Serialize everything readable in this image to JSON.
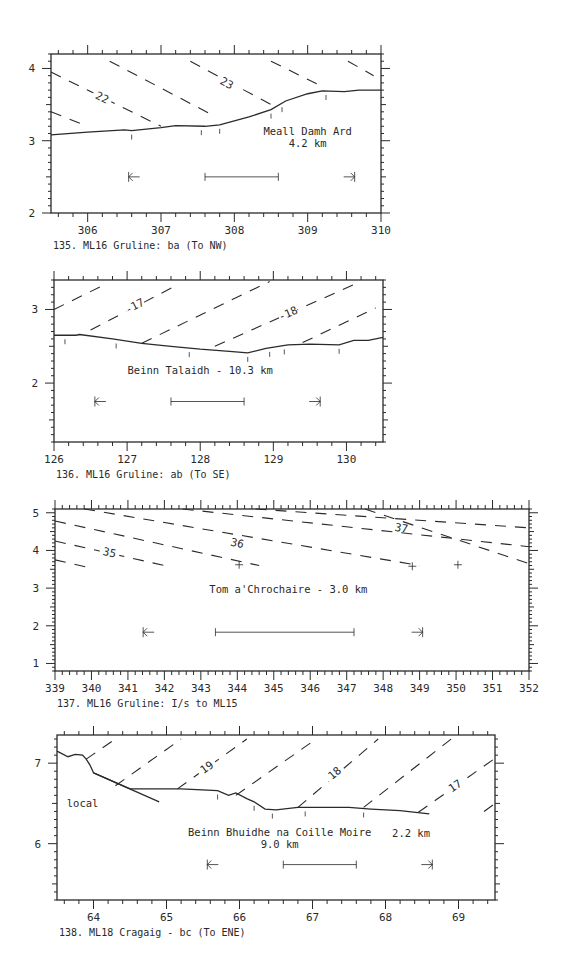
{
  "chart_data": [
    {
      "type": "line",
      "id": "135",
      "caption": "135. ML16 Gruline: ba (To NW)",
      "xlim": [
        305.5,
        310
      ],
      "ylim": [
        2,
        4.2
      ],
      "xticks": [
        306,
        307,
        308,
        309,
        310
      ],
      "yticks": [
        2,
        3,
        4
      ],
      "frame": {
        "left": 51,
        "right": 381,
        "top": 54,
        "bottom": 213
      },
      "profile": [
        [
          305.5,
          3.08
        ],
        [
          306,
          3.12
        ],
        [
          306.5,
          3.15
        ],
        [
          306.6,
          3.14
        ],
        [
          307,
          3.18
        ],
        [
          307.2,
          3.21
        ],
        [
          307.6,
          3.2
        ],
        [
          307.8,
          3.22
        ],
        [
          308.2,
          3.33
        ],
        [
          308.5,
          3.43
        ],
        [
          308.7,
          3.55
        ],
        [
          309,
          3.65
        ],
        [
          309.2,
          3.69
        ],
        [
          309.5,
          3.68
        ],
        [
          309.7,
          3.7
        ],
        [
          310,
          3.7
        ]
      ],
      "profile_ticks": [
        306.6,
        307.55,
        307.8,
        308.5,
        308.65,
        309.25
      ],
      "contours": [
        {
          "from": [
            305.5,
            3.4
          ],
          "to": [
            306,
            3.2
          ]
        },
        {
          "from": [
            305.5,
            3.95
          ],
          "to": [
            307,
            3.2
          ],
          "label": "22",
          "label_at": [
            306.2,
            3.6
          ]
        },
        {
          "from": [
            306.3,
            4.1
          ],
          "to": [
            307.75,
            3.33
          ]
        },
        {
          "from": [
            307.4,
            4.1
          ],
          "to": [
            308.5,
            3.5
          ],
          "label": "23",
          "label_at": [
            307.9,
            3.8
          ]
        },
        {
          "from": [
            308.5,
            4.1
          ],
          "to": [
            309.2,
            3.75
          ]
        },
        {
          "from": [
            309.55,
            4.1
          ],
          "to": [
            309.9,
            3.9
          ]
        }
      ],
      "annotation": {
        "lines": [
          "Meall Damh Ard",
          "4.2 km"
        ],
        "at": [
          309.0,
          3.08
        ]
      },
      "scale_bar": {
        "from": 307.6,
        "to": 308.6,
        "y": 2.5
      },
      "arrows": {
        "left": 306.6,
        "right": 309.6,
        "y": 2.5
      }
    },
    {
      "type": "line",
      "id": "136",
      "caption": "136. ML16 Gruline: ab (To SE)",
      "xlim": [
        126,
        130.5
      ],
      "ylim": [
        1.2,
        3.4
      ],
      "xticks": [
        126,
        127,
        128,
        129,
        130
      ],
      "yticks": [
        2,
        3
      ],
      "frame": {
        "left": 54,
        "right": 383,
        "top": 280,
        "bottom": 442
      },
      "profile": [
        [
          126,
          2.65
        ],
        [
          126.3,
          2.65
        ],
        [
          126.35,
          2.66
        ],
        [
          126.8,
          2.6
        ],
        [
          127.2,
          2.54
        ],
        [
          127.6,
          2.5
        ],
        [
          128.0,
          2.46
        ],
        [
          128.4,
          2.43
        ],
        [
          128.65,
          2.41
        ],
        [
          128.9,
          2.47
        ],
        [
          129.2,
          2.52
        ],
        [
          129.5,
          2.53
        ],
        [
          129.9,
          2.52
        ],
        [
          130.1,
          2.58
        ],
        [
          130.3,
          2.58
        ],
        [
          130.5,
          2.62
        ]
      ],
      "profile_ticks": [
        126.15,
        126.85,
        127.85,
        128.65,
        128.95,
        129.15,
        129.9
      ],
      "contours": [
        {
          "from": [
            126,
            3.0
          ],
          "to": [
            126.7,
            3.34
          ]
        },
        {
          "from": [
            126.5,
            2.72
          ],
          "to": [
            127.7,
            3.34
          ],
          "label": "-17",
          "label_at": [
            127.1,
            3.05
          ]
        },
        {
          "from": [
            127.2,
            2.54
          ],
          "to": [
            128.95,
            3.38
          ]
        },
        {
          "from": [
            128.2,
            2.5
          ],
          "to": [
            130.2,
            3.38
          ],
          "label": "-18",
          "label_at": [
            129.2,
            2.95
          ]
        },
        {
          "from": [
            129.4,
            2.55
          ],
          "to": [
            130.4,
            3.02
          ]
        }
      ],
      "annotation": {
        "lines": [
          "Beinn Talaidh - 10.3 km"
        ],
        "at": [
          128.0,
          2.13
        ]
      },
      "scale_bar": {
        "from": 127.6,
        "to": 128.6,
        "y": 1.75
      },
      "arrows": {
        "left": 126.6,
        "right": 129.6,
        "y": 1.75
      }
    },
    {
      "type": "line",
      "id": "137",
      "caption": "137. ML16 Gruline: I/s to ML15",
      "xlim": [
        339,
        352
      ],
      "ylim": [
        0.8,
        5.1
      ],
      "xticks": [
        339,
        340,
        341,
        342,
        343,
        344,
        345,
        346,
        347,
        348,
        349,
        350,
        351,
        352
      ],
      "yticks": [
        1,
        2,
        3,
        4,
        5
      ],
      "frame": {
        "left": 55,
        "right": 529,
        "top": 509,
        "bottom": 671
      },
      "profile": [],
      "crosses": [
        [
          344.05,
          3.62
        ],
        [
          348.8,
          3.58
        ],
        [
          350.05,
          3.62
        ]
      ],
      "contours": [
        {
          "from": [
            339,
            3.75
          ],
          "to": [
            339.9,
            3.55
          ]
        },
        {
          "from": [
            339,
            4.25
          ],
          "to": [
            342,
            3.6
          ],
          "label": "35",
          "label_at": [
            340.5,
            3.95
          ]
        },
        {
          "from": [
            339,
            4.78
          ],
          "to": [
            344.6,
            3.6
          ],
          "label": "36",
          "label_at": [
            344.0,
            4.2
          ]
        },
        {
          "from": [
            339.8,
            5.1
          ],
          "to": [
            349,
            3.6
          ],
          "label": "37",
          "label_at": [
            348.5,
            4.6
          ]
        },
        {
          "from": [
            342.5,
            5.1
          ],
          "to": [
            352,
            4.1
          ]
        },
        {
          "from": [
            344.5,
            5.1
          ],
          "to": [
            352,
            4.6
          ]
        },
        {
          "from": [
            347.5,
            5.1
          ],
          "to": [
            352,
            3.65
          ]
        }
      ],
      "annotation": {
        "lines": [
          "Tom a'Chrochaire - 3.0 km"
        ],
        "at": [
          345.4,
          2.88
        ]
      },
      "scale_bar": {
        "from": 343.4,
        "to": 347.2,
        "y": 1.83
      },
      "arrows": {
        "left": 341.5,
        "right": 349.0,
        "y": 1.83
      }
    },
    {
      "type": "line",
      "id": "138",
      "caption": "138. ML18 Cragaig - bc (To ENE)",
      "xlim": [
        63.5,
        69.5
      ],
      "ylim": [
        5.3,
        7.35
      ],
      "xticks": [
        64,
        65,
        66,
        67,
        68,
        69
      ],
      "yticks": [
        6,
        7
      ],
      "frame": {
        "left": 57,
        "right": 495,
        "top": 735,
        "bottom": 900
      },
      "profile": [
        [
          63.5,
          7.15
        ],
        [
          63.65,
          7.08
        ],
        [
          63.75,
          7.11
        ],
        [
          63.85,
          7.1
        ],
        [
          63.9,
          7.05
        ],
        [
          63.95,
          6.98
        ],
        [
          64.0,
          6.88
        ],
        [
          64.5,
          6.68
        ],
        [
          65.2,
          6.68
        ],
        [
          65.7,
          6.66
        ],
        [
          65.85,
          6.6
        ],
        [
          65.95,
          6.63
        ],
        [
          66.1,
          6.56
        ],
        [
          66.2,
          6.52
        ],
        [
          66.35,
          6.43
        ],
        [
          66.5,
          6.42
        ],
        [
          66.8,
          6.45
        ],
        [
          67.5,
          6.45
        ],
        [
          67.8,
          6.43
        ],
        [
          68.2,
          6.41
        ],
        [
          68.6,
          6.37
        ]
      ],
      "local_line": [
        [
          64.0,
          6.88
        ],
        [
          64.9,
          6.52
        ]
      ],
      "profile_ticks": [
        65.7,
        66.2,
        66.45,
        66.9,
        67.7
      ],
      "contours": [
        {
          "from": [
            63.9,
            7.05
          ],
          "to": [
            64.3,
            7.3
          ]
        },
        {
          "from": [
            64.3,
            6.72
          ],
          "to": [
            65.2,
            7.3
          ]
        },
        {
          "from": [
            65.15,
            6.68
          ],
          "to": [
            66.1,
            7.3
          ],
          "label": "19",
          "label_at": [
            65.55,
            6.95
          ]
        },
        {
          "from": [
            65.95,
            6.6
          ],
          "to": [
            67.05,
            7.3
          ]
        },
        {
          "from": [
            66.8,
            6.45
          ],
          "to": [
            67.9,
            7.3
          ],
          "label": "18",
          "label_at": [
            67.3,
            6.88
          ]
        },
        {
          "from": [
            67.7,
            6.45
          ],
          "to": [
            68.9,
            7.3
          ]
        },
        {
          "from": [
            68.45,
            6.39
          ],
          "to": [
            69.5,
            7.06
          ],
          "label": "17",
          "label_at": [
            68.95,
            6.72
          ]
        },
        {
          "from": [
            69.35,
            6.4
          ],
          "to": [
            69.5,
            6.5
          ]
        }
      ],
      "local_label": {
        "text": "local",
        "at": [
          63.85,
          6.46
        ]
      },
      "annotation": {
        "lines": [
          "Beinn Bhuidhe na Coille Moire",
          "9.0 km"
        ],
        "at": [
          66.55,
          6.1
        ]
      },
      "annotation_extra": {
        "text": "2.2 km",
        "at": [
          68.35,
          6.08
        ]
      },
      "scale_bar": {
        "from": 66.6,
        "to": 67.6,
        "y": 5.74
      },
      "arrows": {
        "left": 65.6,
        "right": 68.6,
        "y": 5.74
      }
    }
  ]
}
